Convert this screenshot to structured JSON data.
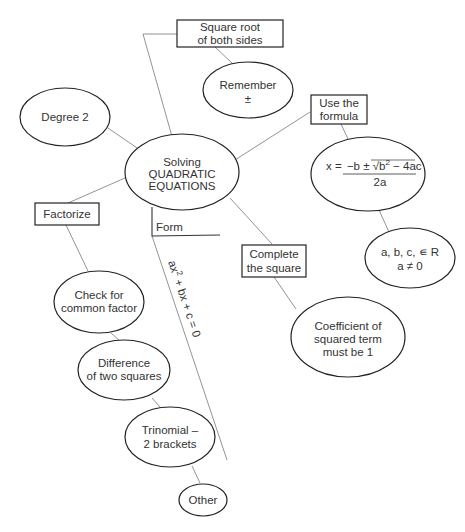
{
  "diagram": {
    "type": "mind-map",
    "central": {
      "line1": "Solving",
      "line2": "QUADRATIC",
      "line3": "EQUATIONS"
    },
    "nodes": {
      "square_root": {
        "shape": "box",
        "line1": "Square root",
        "line2": "of both sides"
      },
      "remember": {
        "shape": "ellipse",
        "line1": "Remember",
        "line2": "±"
      },
      "degree2": {
        "shape": "ellipse",
        "label": "Degree 2"
      },
      "use_formula": {
        "shape": "box",
        "line1": "Use the",
        "line2": "formula"
      },
      "formula": {
        "shape": "ellipse",
        "lhs": "x =",
        "numerator_prefix": "−b ± ",
        "sqrt_sign": "√",
        "radicand_b": "b",
        "radicand_exp": "2",
        "radicand_rest": " − 4ac",
        "denominator": "2a"
      },
      "conditions": {
        "shape": "ellipse",
        "line1": "a, b, c, ∊ R",
        "line2": "a ≠ 0"
      },
      "factorize": {
        "shape": "box",
        "label": "Factorize"
      },
      "form": {
        "shape": "line-label",
        "label": "Form"
      },
      "standard_form": {
        "a": "ax",
        "exp": "2",
        "rest": " + bx + c = 0"
      },
      "complete_square": {
        "shape": "box",
        "line1": "Complete",
        "line2": "the square"
      },
      "coefficient": {
        "shape": "ellipse",
        "line1": "Coefficient of",
        "line2": "squared term",
        "line3": "must be 1"
      },
      "common_factor": {
        "shape": "ellipse",
        "line1": "Check for",
        "line2": "common factor"
      },
      "difference": {
        "shape": "ellipse",
        "line1": "Difference",
        "line2": "of two squares"
      },
      "trinomial": {
        "shape": "ellipse",
        "line1": "Trinomial –",
        "line2": "2 brackets"
      },
      "other": {
        "shape": "ellipse",
        "label": "Other"
      }
    },
    "colors": {
      "stroke": "#222222",
      "edge": "#777777",
      "text": "#333333",
      "background": "#ffffff"
    }
  }
}
